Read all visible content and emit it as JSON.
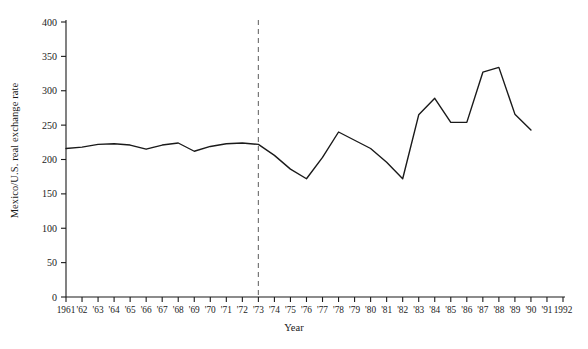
{
  "chart_data": {
    "type": "line",
    "title": "",
    "xlabel": "Year",
    "ylabel": "Mexico/U.S. real exchange rate",
    "xlim": [
      1961,
      1992
    ],
    "ylim": [
      0,
      400
    ],
    "ytick_values": [
      0,
      50,
      100,
      150,
      200,
      250,
      300,
      350,
      400
    ],
    "ytick_labels": [
      "0",
      "50",
      "100",
      "150",
      "200",
      "250",
      "300",
      "350",
      "400"
    ],
    "xtick_values": [
      1961,
      1962,
      1963,
      1964,
      1965,
      1966,
      1967,
      1968,
      1969,
      1970,
      1971,
      1972,
      1973,
      1974,
      1975,
      1976,
      1977,
      1978,
      1979,
      1980,
      1981,
      1982,
      1983,
      1984,
      1985,
      1986,
      1987,
      1988,
      1989,
      1990,
      1991,
      1992
    ],
    "xtick_labels": [
      "1961",
      "'62",
      "'63",
      "'64",
      "'65",
      "'66",
      "'67",
      "'68",
      "'69",
      "'70",
      "'71",
      "'72",
      "'73",
      "'74",
      "'75",
      "'76",
      "'77",
      "'78",
      "'79",
      "'80",
      "'81",
      "'82",
      "'83",
      "'84",
      "'85",
      "'86",
      "'87",
      "'88",
      "'89",
      "'90",
      "'91",
      "1992"
    ],
    "grid": false,
    "legend": false,
    "line_color": "#1a1a1a",
    "series": [
      {
        "name": "Mexico/U.S. real exchange rate",
        "x": [
          1961,
          1962,
          1963,
          1964,
          1965,
          1966,
          1967,
          1968,
          1969,
          1970,
          1971,
          1972,
          1973,
          1974,
          1975,
          1976,
          1977,
          1978,
          1979,
          1980,
          1981,
          1982,
          1983,
          1984,
          1985,
          1986,
          1987,
          1988,
          1989,
          1990
        ],
        "values": [
          216,
          218,
          222,
          223,
          221,
          215,
          221,
          224,
          212,
          219,
          223,
          224,
          222,
          206,
          186,
          172,
          203,
          240,
          228,
          216,
          196,
          172,
          265,
          289,
          254,
          254,
          327,
          334,
          266,
          243
        ]
      }
    ],
    "annotations": [
      {
        "name": "regime-break-line",
        "type": "vertical-dashed-line",
        "x": 1973,
        "color": "#777777"
      }
    ]
  }
}
